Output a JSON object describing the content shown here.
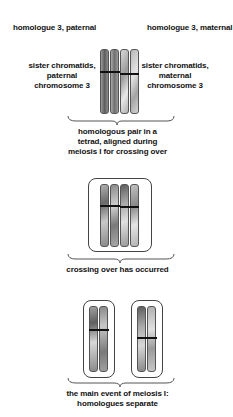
{
  "labels": {
    "homologue_paternal": "homologue 3, paternal",
    "homologue_maternal": "homologue 3, maternal",
    "sister_paternal": [
      "sister chromatids,",
      "paternal",
      "chromosome 3"
    ],
    "sister_maternal": [
      "sister chromatids,",
      "maternal",
      "chromosome 3"
    ],
    "stage1": [
      "homologous pair in a",
      "tetrad, aligned during",
      "meiosis I for crossing over"
    ],
    "stage2": [
      "crossing over has occurred"
    ],
    "stage3": [
      "the main event of meiosis I:",
      "homologues separate"
    ]
  },
  "colors": {
    "paternal_dark": "#6e6e6e",
    "paternal_light": "#c8c8c8",
    "maternal_dark": "#8a8a8a",
    "maternal_light": "#e2e2e2",
    "centromere": "#111111",
    "outline": "#444444"
  }
}
